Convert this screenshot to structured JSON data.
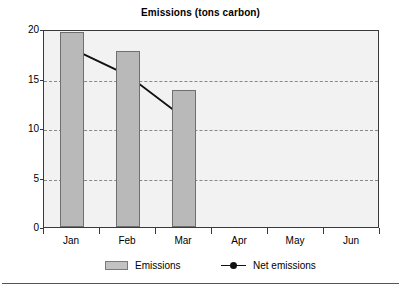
{
  "chart_data": {
    "type": "bar",
    "title": "Emissions (tons carbon)",
    "xlabel": "",
    "ylabel": "",
    "categories": [
      "Jan",
      "Feb",
      "Mar",
      "Apr",
      "May",
      "Jun"
    ],
    "ylim": [
      0,
      20
    ],
    "yticks": [
      0,
      5,
      10,
      15,
      20
    ],
    "ytick_labels": [
      "0",
      "5",
      "10",
      "15",
      "20"
    ],
    "grid": true,
    "legend_position": "bottom",
    "series": [
      {
        "name": "Emissions",
        "type": "bar",
        "color": "#b9b9b9",
        "values": [
          19.7,
          17.8,
          13.8,
          null,
          null,
          null
        ]
      },
      {
        "name": "Net emissions",
        "type": "line",
        "color": "#111111",
        "marker": "circle",
        "values": [
          18.2,
          15.5,
          11.2,
          null,
          null,
          null
        ]
      }
    ]
  },
  "legend": {
    "entries": [
      {
        "label": "Emissions",
        "swatch": "bar-swatch"
      },
      {
        "label": "Net emissions",
        "swatch": "line-marker-swatch"
      }
    ]
  }
}
